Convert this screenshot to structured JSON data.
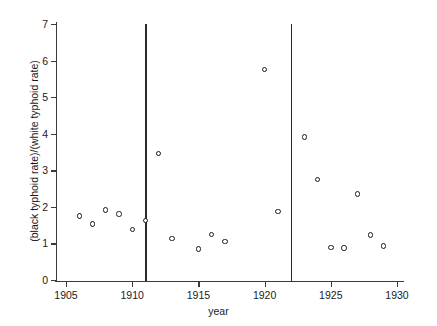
{
  "chart_data": {
    "type": "scatter",
    "title": "",
    "xlabel": "year",
    "ylabel": "(black typhoid rate)/(white typhoid rate)",
    "xlim": [
      1904,
      1930.5
    ],
    "ylim": [
      0,
      7
    ],
    "grid": false,
    "legend": null,
    "xticks": [
      1905,
      1910,
      1915,
      1920,
      1925,
      1930
    ],
    "xticklabels": [
      "1905",
      "1910",
      "1915",
      "1920",
      "1925",
      "1930"
    ],
    "yticks": [
      0,
      1,
      2,
      3,
      4,
      5,
      6,
      7
    ],
    "yticklabels": [
      "0",
      "1",
      "2",
      "3",
      "4",
      "5",
      "6",
      "7"
    ],
    "x": [
      1906,
      1907,
      1908,
      1909,
      1910,
      1911,
      1912,
      1913,
      1915,
      1916,
      1917,
      1920,
      1921,
      1923,
      1924,
      1925,
      1926,
      1927,
      1928,
      1929
    ],
    "values": [
      1.75,
      1.53,
      1.91,
      1.81,
      1.38,
      1.63,
      3.46,
      1.13,
      0.85,
      1.25,
      1.06,
      5.76,
      1.87,
      3.91,
      2.75,
      0.89,
      0.87,
      2.35,
      1.23,
      0.93
    ],
    "annotations": [
      {
        "type": "vline",
        "x": 1911,
        "label": ""
      },
      {
        "type": "vline",
        "x": 1922,
        "label": ""
      }
    ],
    "marker": "open-circle",
    "marker_color": "#1a1a1a"
  }
}
